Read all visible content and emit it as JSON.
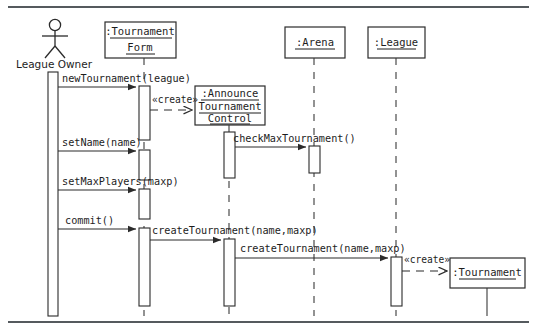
{
  "diagram": {
    "type": "uml-sequence-diagram",
    "actor": {
      "name": "League Owner",
      "icon": "stick-figure-actor-icon"
    },
    "lifelines": [
      {
        "id": "form",
        "label_lines": [
          "  :Tournament",
          "Form"
        ],
        "underline": true
      },
      {
        "id": "control",
        "label_lines": [
          ":Announce",
          "Tournament",
          "Control"
        ],
        "underline": true
      },
      {
        "id": "arena",
        "label_lines": [
          ":Arena"
        ],
        "underline": true
      },
      {
        "id": "league",
        "label_lines": [
          ":League"
        ],
        "underline": true
      },
      {
        "id": "tournament",
        "label_lines": [
          ":Tournament"
        ],
        "underline": true
      }
    ],
    "messages": [
      {
        "id": "m1",
        "label": "newTournament(league)",
        "kind": "call",
        "from": "actor",
        "to": "form"
      },
      {
        "id": "m2",
        "label": "«create»",
        "kind": "create",
        "from": "form",
        "to": "control"
      },
      {
        "id": "m3",
        "label": "checkMaxTournament()",
        "kind": "call",
        "from": "control",
        "to": "arena"
      },
      {
        "id": "m4",
        "label": "setName(name)",
        "kind": "call",
        "from": "actor",
        "to": "form"
      },
      {
        "id": "m5",
        "label": "setMaxPlayers(maxp)",
        "kind": "call",
        "from": "actor",
        "to": "form"
      },
      {
        "id": "m6",
        "label": "commit()",
        "kind": "call",
        "from": "actor",
        "to": "form"
      },
      {
        "id": "m7",
        "label": "createTournament(name,maxp)",
        "kind": "call",
        "from": "form",
        "to": "control"
      },
      {
        "id": "m8",
        "label": "createTournament(name,maxp)",
        "kind": "call",
        "from": "control",
        "to": "league"
      },
      {
        "id": "m9",
        "label": "«create»",
        "kind": "create",
        "from": "league",
        "to": "tournament"
      }
    ],
    "colors": {
      "stroke": "#2b2b2b",
      "frame": "#555a5e",
      "background": "#ffffff"
    }
  }
}
